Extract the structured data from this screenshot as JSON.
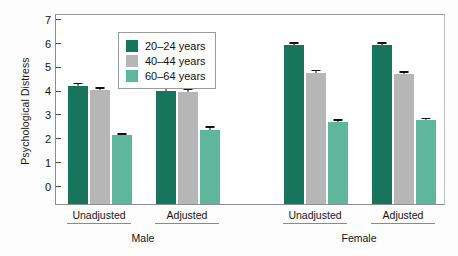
{
  "chart_data": {
    "type": "bar",
    "title": "",
    "xlabel": "",
    "ylabel": "Psychological Distress",
    "ylim": [
      0,
      8
    ],
    "yticks": [
      0,
      1,
      2,
      3,
      4,
      5,
      6,
      7,
      8
    ],
    "grid": false,
    "legend_position": "top-left",
    "legend": [
      "20–24 years",
      "40–44 years",
      "60–64 years"
    ],
    "colors": [
      "#17755b",
      "#b6b6b6",
      "#5fb79b"
    ],
    "group_labels": [
      "Male",
      "Female"
    ],
    "categories": [
      "Male – Unadjusted",
      "Male – Adjusted",
      "Female – Unadjusted",
      "Female – Adjusted"
    ],
    "series": [
      {
        "name": "20–24 years",
        "values": [
          4.95,
          4.72,
          6.65,
          6.65
        ],
        "errors": [
          0.14,
          0.17,
          0.12,
          0.12
        ]
      },
      {
        "name": "40–44 years",
        "values": [
          4.78,
          4.68,
          5.5,
          5.45
        ],
        "errors": [
          0.12,
          0.16,
          0.12,
          0.12
        ]
      },
      {
        "name": "60–64 years",
        "values": [
          2.87,
          3.1,
          3.45,
          3.5
        ],
        "errors": [
          0.09,
          0.15,
          0.1,
          0.12
        ]
      }
    ]
  },
  "axis": {
    "y_title": "Psychological Distress",
    "y_tick_labels": [
      "8",
      "7",
      "6",
      "5",
      "4",
      "3",
      "2",
      "1",
      "0"
    ]
  },
  "legend": {
    "items": [
      {
        "label": "20–24 years",
        "color": "#17755b"
      },
      {
        "label": "40–44 years",
        "color": "#b6b6b6"
      },
      {
        "label": "60–64 years",
        "color": "#5fb79b"
      }
    ]
  },
  "x_axis": {
    "male": {
      "label": "Male",
      "sub": [
        "Unadjusted",
        "Adjusted"
      ]
    },
    "female": {
      "label": "Female",
      "sub": [
        "Unadjusted",
        "Adjusted"
      ]
    }
  }
}
